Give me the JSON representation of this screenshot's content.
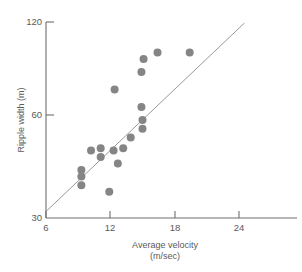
{
  "figure": {
    "name": "scatter-plot-ripple-width-vs-velocity",
    "background_color": "#ffffff",
    "point_color": "#858585",
    "line_color": "#8d8d8d",
    "axis_color": "#6e6e6e"
  },
  "axes": {
    "x": {
      "title": "Average velocity",
      "unit": "(m/sec)",
      "ticks": [
        "6",
        "12",
        "18",
        "24"
      ],
      "tick_values": [
        6,
        12,
        18,
        24
      ],
      "min": 6,
      "max": 27.5
    },
    "y": {
      "title": "Ripple width (m)",
      "ticks": [
        "120",
        "60",
        "30"
      ],
      "tick_values": [
        120,
        60,
        30
      ],
      "min": 30,
      "max": 120
    }
  },
  "chart_data": {
    "type": "scatter",
    "title": "",
    "xlabel": "Average velocity (m/sec)",
    "ylabel": "Ripple width (m)",
    "xlim": [
      6,
      27.5
    ],
    "ylim": [
      30,
      120
    ],
    "grid": false,
    "legend": null,
    "x": [
      9.3,
      9.3,
      9.3,
      10.2,
      11.1,
      11.1,
      11.9,
      12.3,
      12.4,
      12.7,
      13.2,
      13.9,
      14.9,
      14.9,
      15.0,
      15.0,
      15.1,
      16.4,
      19.4
    ],
    "y": [
      52,
      49,
      45,
      61,
      62,
      58,
      42,
      61,
      89,
      55,
      62,
      67,
      97,
      81,
      75,
      71,
      103,
      106,
      106
    ],
    "points": [
      {
        "x": 9.3,
        "y": 52
      },
      {
        "x": 9.3,
        "y": 49
      },
      {
        "x": 9.3,
        "y": 45
      },
      {
        "x": 10.2,
        "y": 61
      },
      {
        "x": 11.1,
        "y": 62
      },
      {
        "x": 11.1,
        "y": 58
      },
      {
        "x": 11.9,
        "y": 42
      },
      {
        "x": 12.3,
        "y": 61
      },
      {
        "x": 12.4,
        "y": 89
      },
      {
        "x": 12.7,
        "y": 55
      },
      {
        "x": 13.2,
        "y": 62
      },
      {
        "x": 13.9,
        "y": 67
      },
      {
        "x": 14.9,
        "y": 97
      },
      {
        "x": 14.9,
        "y": 81
      },
      {
        "x": 15.0,
        "y": 75
      },
      {
        "x": 15.0,
        "y": 71
      },
      {
        "x": 15.1,
        "y": 103
      },
      {
        "x": 16.4,
        "y": 106
      },
      {
        "x": 19.4,
        "y": 106
      }
    ],
    "marker_size": 4,
    "fit_line": {
      "type": "linear",
      "x_start": 6.0,
      "y_start": 33.0,
      "x_end": 24.5,
      "y_end": 119.5,
      "slope": 4.68,
      "intercept": 4.9
    }
  },
  "caption": {
    "partial_text": ""
  }
}
